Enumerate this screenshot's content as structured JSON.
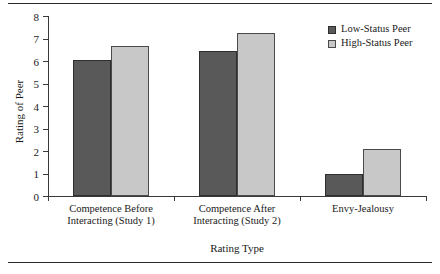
{
  "chart_data": {
    "type": "bar",
    "title": "",
    "xlabel": "Rating Type",
    "ylabel": "Rating of Peer",
    "categories": [
      "Competence Before Interacting (Study 1)",
      "Competence After Interacting (Study 2)",
      "Envy-Jealousy"
    ],
    "series": [
      {
        "name": "Low-Status Peer",
        "color": "#595959",
        "values": [
          6.05,
          6.45,
          1.0
        ]
      },
      {
        "name": "High-Status Peer",
        "color": "#c8c8c8",
        "values": [
          6.65,
          7.25,
          2.1
        ]
      }
    ],
    "ylim": [
      0,
      8
    ],
    "yticks": [
      0,
      1,
      2,
      3,
      4,
      5,
      6,
      7,
      8
    ],
    "ytick_labels": [
      "0",
      "1",
      "2",
      "3",
      "4",
      "5",
      "6",
      "7",
      "8"
    ],
    "grid": false,
    "legend_position": "top-right"
  },
  "legend": {
    "items": [
      {
        "label": "Low-Status Peer"
      },
      {
        "label": "High-Status Peer"
      }
    ]
  },
  "category_lines": [
    [
      "Competence Before",
      "Interacting (Study 1)"
    ],
    [
      "Competence After",
      "Interacting (Study 2)"
    ],
    [
      "Envy-Jealousy",
      ""
    ]
  ]
}
